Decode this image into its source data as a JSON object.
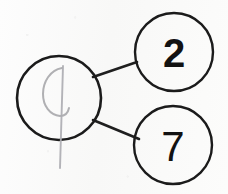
{
  "diagram": {
    "type": "number-bond",
    "background_color": "#fbfbfa",
    "ink_color": "#1b1b1b",
    "pencil_color": "#a9a9ad",
    "whole": {
      "label": "",
      "written_mark": "faint erased handwritten digit",
      "center_x": 59,
      "center_y": 98,
      "radius": 42
    },
    "parts": [
      {
        "name": "part-top",
        "value": "2",
        "center_x": 174,
        "center_y": 52,
        "radius": 39
      },
      {
        "name": "part-bottom",
        "value": "7",
        "center_x": 173,
        "center_y": 145,
        "radius": 39
      }
    ],
    "links": [
      {
        "name": "link-whole-to-top",
        "x1": 93,
        "y1": 77,
        "x2": 137,
        "y2": 62
      },
      {
        "name": "link-whole-to-bottom",
        "x1": 93,
        "y1": 120,
        "x2": 139,
        "y2": 139
      }
    ]
  }
}
